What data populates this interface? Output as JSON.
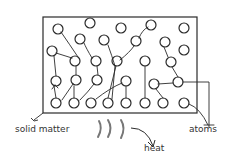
{
  "diagram": {
    "title": "",
    "labels": {
      "solid_matter": "solid matter",
      "atoms": "atoms",
      "heat": "heat"
    },
    "colors": {
      "stroke": "#2a2a2a",
      "heat_waves": "#777777",
      "background": "#ffffff"
    },
    "box": {
      "x": 43,
      "y": 17,
      "w": 154,
      "h": 96
    },
    "atoms": [
      [
        58,
        29
      ],
      [
        90,
        23
      ],
      [
        121,
        28
      ],
      [
        151,
        25
      ],
      [
        184,
        28
      ],
      [
        80,
        39
      ],
      [
        104,
        40
      ],
      [
        136,
        41
      ],
      [
        165,
        42
      ],
      [
        52,
        51
      ],
      [
        184,
        50
      ],
      [
        75,
        61
      ],
      [
        96,
        61
      ],
      [
        117,
        61
      ],
      [
        145,
        61
      ],
      [
        171,
        62
      ],
      [
        56,
        81
      ],
      [
        76,
        80
      ],
      [
        97,
        80
      ],
      [
        126,
        81
      ],
      [
        154,
        84
      ],
      [
        178,
        82
      ],
      [
        56,
        103
      ],
      [
        74,
        103
      ],
      [
        91,
        103
      ],
      [
        108,
        103
      ],
      [
        126,
        103
      ],
      [
        145,
        103
      ],
      [
        163,
        103
      ],
      [
        184,
        103
      ]
    ]
  }
}
